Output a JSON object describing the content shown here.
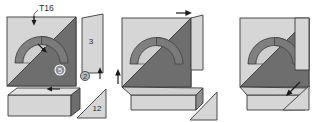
{
  "figure": {
    "title": "T16",
    "background_color": "#ffffff",
    "palette": {
      "light_fill": "#d6d6d6",
      "mid_fill": "#b9b9b9",
      "dark_fill": "#6e6e6e",
      "arc_fill": "#808080",
      "arc_inner": "#c9c9c9",
      "outline": "#3a3a3a",
      "arrow": "#1a1a1a",
      "label_text": "#2b2b2b",
      "badge_text": "#ffffff"
    }
  },
  "panels": [
    {
      "id": "panel-1",
      "name": "exploded-view",
      "labels": [
        {
          "id": "label-t16",
          "text": "T16",
          "kind": "leader",
          "x": 39,
          "y": 9
        },
        {
          "id": "label-5",
          "text": "5",
          "kind": "circled-badge",
          "x": 60,
          "y": 70
        },
        {
          "id": "label-3",
          "text": "3",
          "kind": "plain",
          "x": 91,
          "y": 41
        },
        {
          "id": "label-2",
          "text": "2",
          "kind": "circled-outline",
          "x": 85,
          "y": 76
        },
        {
          "id": "label-12",
          "text": "12",
          "kind": "plain",
          "x": 97,
          "y": 108
        }
      ],
      "arrows": [
        {
          "id": "arrow-into-arc",
          "direction": "down",
          "x": 34,
          "y": 20
        },
        {
          "id": "arrow-into-triangle",
          "direction": "down-right",
          "x": 44,
          "y": 50
        },
        {
          "id": "arrow-strip-left",
          "direction": "left",
          "x": 52,
          "y": 89
        },
        {
          "id": "arrow-strip-up",
          "direction": "up",
          "x": 100,
          "y": 72
        }
      ]
    },
    {
      "id": "panel-2",
      "name": "partial-assembly-view",
      "labels": [],
      "arrows": [
        {
          "id": "arrow-top-right",
          "direction": "right",
          "x": 185,
          "y": 13
        },
        {
          "id": "arrow-left-up",
          "direction": "up",
          "x": 118,
          "y": 74
        }
      ]
    },
    {
      "id": "panel-3",
      "name": "assembled-view",
      "labels": [],
      "arrows": [
        {
          "id": "arrow-insert-diagonal",
          "direction": "down-left",
          "x": 292,
          "y": 92
        }
      ]
    }
  ]
}
